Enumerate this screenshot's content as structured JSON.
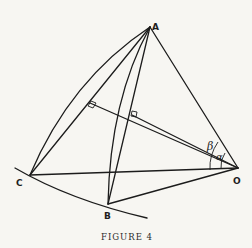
{
  "figure": {
    "caption": "FIGURE 4",
    "points": {
      "A": {
        "label": "A",
        "x": 150,
        "y": 27
      },
      "B": {
        "label": "B",
        "x": 108,
        "y": 204
      },
      "C": {
        "label": "C",
        "x": 30,
        "y": 175
      },
      "O": {
        "label": "O",
        "x": 238,
        "y": 168
      }
    },
    "angles": {
      "alpha": {
        "label": "α"
      },
      "beta": {
        "label": "β"
      }
    },
    "colors": {
      "ink": "#1c1c1c",
      "paper": "#f7f6f2"
    }
  }
}
